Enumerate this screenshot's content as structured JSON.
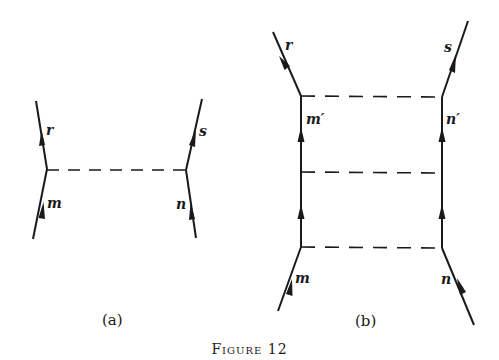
{
  "figure": {
    "caption": "Figure 12",
    "diagram_a": {
      "label": "(a)",
      "lines": {
        "top_left": "r",
        "bottom_left": "m",
        "top_right": "s",
        "bottom_right": "n"
      }
    },
    "diagram_b": {
      "label": "(b)",
      "lines": {
        "top_left": "r",
        "mid_left": "m′",
        "bottom_left": "m",
        "top_right": "s",
        "mid_right": "n′",
        "bottom_right": "n"
      },
      "rungs": 3
    }
  },
  "colors": {
    "ink": "#1a1a1a",
    "background": "#ffffff"
  }
}
